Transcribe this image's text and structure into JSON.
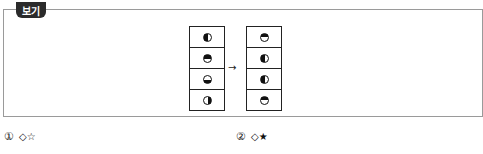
{
  "box": {
    "label": "보기",
    "arrow": "→",
    "left_column": [
      {
        "state": "half-left",
        "icon": "moon-left-dark-icon"
      },
      {
        "state": "half-top",
        "icon": "moon-top-dark-icon"
      },
      {
        "state": "half-bottom",
        "icon": "moon-bottom-dark-icon"
      },
      {
        "state": "half-right",
        "icon": "moon-right-dark-icon"
      }
    ],
    "right_column": [
      {
        "state": "half-top",
        "icon": "moon-top-dark-icon"
      },
      {
        "state": "half-left",
        "icon": "moon-left-dark-icon"
      },
      {
        "state": "half-left",
        "icon": "moon-left-dark-icon"
      },
      {
        "state": "half-top",
        "icon": "moon-top-dark-icon"
      }
    ]
  },
  "options": [
    {
      "number": "①",
      "symbols": "◇☆"
    },
    {
      "number": "②",
      "symbols": "◇★"
    }
  ]
}
